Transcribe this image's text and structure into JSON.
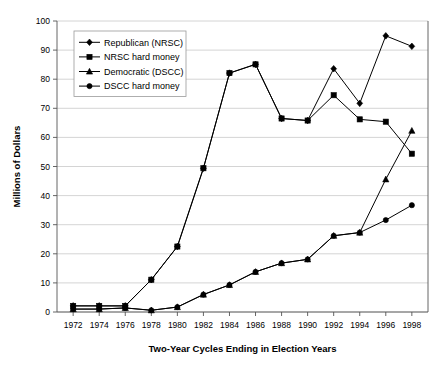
{
  "chart_data": {
    "type": "line",
    "title": "",
    "xlabel": "Two-Year Cycles Ending in Election Years",
    "ylabel": "Millions of Dollars",
    "xlim": [
      1971,
      1999
    ],
    "ylim": [
      0,
      100
    ],
    "ytick_step": 10,
    "grid": true,
    "legend_position": "top-left-inside",
    "categories": [
      1972,
      1974,
      1976,
      1978,
      1980,
      1982,
      1984,
      1986,
      1988,
      1990,
      1992,
      1994,
      1996,
      1998
    ],
    "x": [
      "1972",
      "1974",
      "1976",
      "1978",
      "1980",
      "1982",
      "1984",
      "1986",
      "1988",
      "1990",
      "1992",
      "1994",
      "1996",
      "1998"
    ],
    "yticks": [
      "0",
      "10",
      "20",
      "30",
      "40",
      "50",
      "60",
      "70",
      "80",
      "90",
      "100"
    ],
    "series": [
      {
        "name": "Republican (NRSC)",
        "marker": "diamond",
        "values": [
          2.1,
          2.1,
          2.1,
          11.1,
          22.5,
          49.4,
          82.1,
          85.1,
          66.5,
          65.8,
          83.6,
          71.7,
          94.9,
          91.3
        ]
      },
      {
        "name": "NRSC hard money",
        "marker": "square",
        "values": [
          2.1,
          2.1,
          2.1,
          11.1,
          22.5,
          49.4,
          82.1,
          85.1,
          66.5,
          65.8,
          74.5,
          66.2,
          65.4,
          54.4
        ]
      },
      {
        "name": "Democratic (DSCC)",
        "marker": "triangle",
        "values": [
          1.0,
          1.0,
          1.4,
          0.6,
          1.7,
          6.0,
          9.3,
          13.8,
          16.8,
          18.1,
          26.2,
          27.3,
          45.6,
          62.3
        ]
      },
      {
        "name": "DSCC hard money",
        "marker": "circle",
        "values": [
          1.0,
          1.0,
          1.4,
          0.6,
          1.7,
          6.0,
          9.3,
          13.8,
          16.8,
          18.1,
          26.2,
          27.3,
          31.6,
          36.7
        ]
      }
    ]
  },
  "legend": {
    "entries": [
      {
        "label": "Republican (NRSC)"
      },
      {
        "label": "NRSC hard money"
      },
      {
        "label": "Democratic (DSCC)"
      },
      {
        "label": "DSCC hard money"
      }
    ]
  },
  "axes": {
    "y_title": "Millions of Dollars",
    "x_title": "Two-Year Cycles Ending in Election Years"
  },
  "colors": {
    "series": "#000000",
    "grid": "#c9c9c9",
    "axis": "#555555",
    "background": "#ffffff"
  }
}
